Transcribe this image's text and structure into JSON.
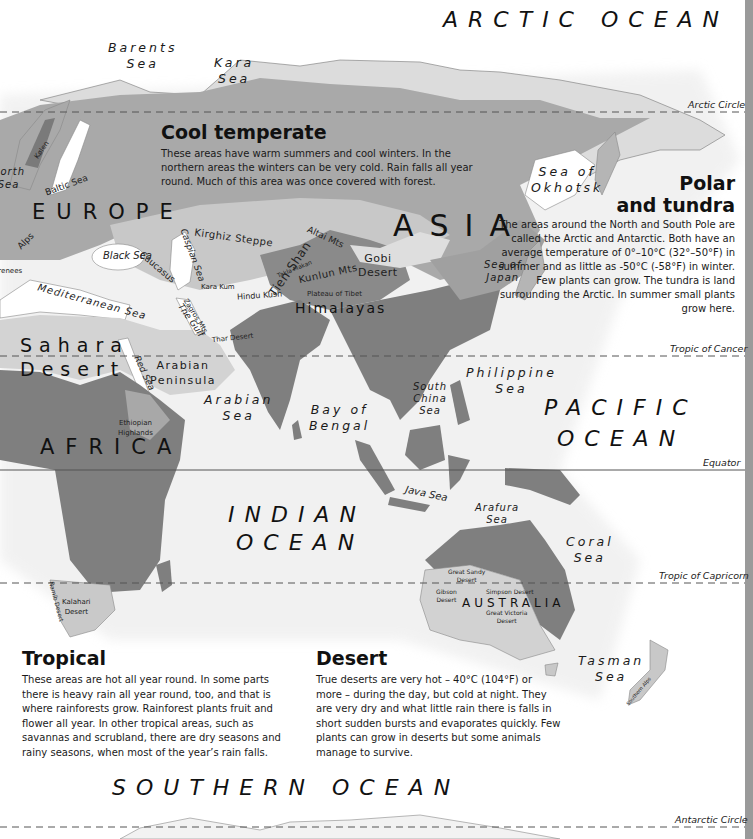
{
  "colors": {
    "background": "#ffffff",
    "land_outline": "#d9d9d9",
    "cool_temperate": "#a9a9a9",
    "desert": "#cfcfcf",
    "tropical": "#7f7f7f",
    "mountain": "#8e8e8e",
    "polar": "#dcdcdc",
    "grid_line": "#555555",
    "scrollbar": "#9a9a9a"
  },
  "lines": {
    "arctic_circle": "Arctic Circle",
    "tropic_of_cancer": "Tropic of Cancer",
    "equator": "Equator",
    "tropic_of_capricorn": "Tropic of Capricorn",
    "antarctic_circle": "Antarctic Circle"
  },
  "oceans": {
    "arctic": "ARCTIC OCEAN",
    "pacific_1": "PACIFIC",
    "pacific_2": "OCEAN",
    "indian_1": "INDIAN",
    "indian_2": "OCEAN",
    "southern": "SOUTHERN OCEAN"
  },
  "seas": {
    "barents": [
      "Barents",
      "Sea"
    ],
    "kara": [
      "Kara",
      "Sea"
    ],
    "north": [
      "North",
      "Sea"
    ],
    "baltic": "Baltic Sea",
    "black": "Black Sea",
    "caspian": "Caspian Sea",
    "mediterranean": "Mediterranean Sea",
    "red": "Red Sea",
    "the_gulf": "The Gulf",
    "arabian": [
      "Arabian",
      "Sea"
    ],
    "bay_of_bengal": [
      "Bay of",
      "Bengal"
    ],
    "south_china": [
      "South",
      "China",
      "Sea"
    ],
    "philippine": [
      "Philippine",
      "Sea"
    ],
    "okhotsk": [
      "Sea of",
      "Okhotsk"
    ],
    "japan": [
      "Sea of",
      "Japan"
    ],
    "java": "Java Sea",
    "arafura": [
      "Arafura",
      "Sea"
    ],
    "coral": [
      "Coral",
      "Sea"
    ],
    "tasman": [
      "Tasman",
      "Sea"
    ]
  },
  "continents": {
    "europe": "EUROPE",
    "asia": "ASIA",
    "africa": "AFRICA",
    "australia": "AUSTRALIA"
  },
  "regions": {
    "sahara": [
      "Sahara",
      "Desert"
    ],
    "arabian_peninsula": [
      "Arabian",
      "Peninsula"
    ],
    "himalayas": "Himalayas",
    "gobi": [
      "Gobi",
      "Desert"
    ],
    "tien_shan": "Tien Shan",
    "kunlun": "Kunlun Mts",
    "altai": "Altai Mts",
    "kirghiz": "Kirghiz Steppe",
    "caucasus": "Caucasus",
    "alps": "Alps",
    "pyrenees": "Pyrenees",
    "kolen": "Kølen",
    "kara_kum": "Kara Kum",
    "hindu_kush": "Hindu Kush",
    "takla_makan": "Takla Makan",
    "plateau_tibet": "Plateau of Tibet",
    "zagros": "Zagros Mts",
    "thar": "Thar Desert",
    "ethiopian": [
      "Ethiopian",
      "Highlands"
    ],
    "kalahari": [
      "Kalahari",
      "Desert"
    ],
    "namib": "Namib Desert",
    "great_sandy": [
      "Great Sandy",
      "Desert"
    ],
    "gibson": [
      "Gibson",
      "Desert"
    ],
    "simpson": "Simpson Desert",
    "great_victoria": [
      "Great Victoria",
      "Desert"
    ],
    "southern_alps": "Southern Alps"
  },
  "panels": {
    "cool_temperate": {
      "title": "Cool temperate",
      "text": "These areas have warm summers and cool winters. In the northern areas the winters can be very cold. Rain falls all year round. Much of this area was once covered with forest."
    },
    "polar": {
      "title_1": "Polar",
      "title_2": "and tundra",
      "text": "The areas around the North and South Pole are called the Arctic and Antarctic. Both have an average temperature of 0°–10°C (32°–50°F) in summer and as little as -50°C (-58°F) in winter. Few plants can grow. The tundra is land surrounding the Arctic. In summer small plants grow here."
    },
    "tropical": {
      "title": "Tropical",
      "text": "These areas are hot all year round. In some parts there is heavy rain all year round, too, and that is where rainforests grow. Rainforest plants fruit and flower all year. In other tropical areas, such as savannas and scrubland, there are dry seasons and rainy seasons, when most of the year’s rain falls."
    },
    "desert": {
      "title": "Desert",
      "text": "True deserts are very hot – 40°C (104°F) or more – during the day, but cold at night. They are very dry and what little rain there is falls in short sudden bursts and evaporates quickly. Few plants can grow in deserts but some animals manage to survive."
    }
  }
}
